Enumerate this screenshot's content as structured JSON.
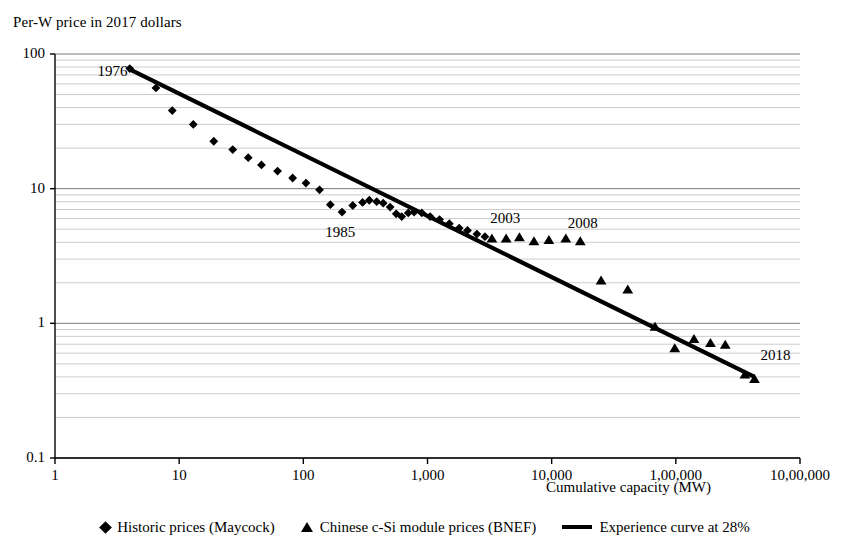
{
  "chart_data": {
    "type": "scatter",
    "title": "",
    "ylabel": "Per-W price in 2017 dollars",
    "xlabel": "Cumulative capacity (MW)",
    "xscale": "log",
    "yscale": "log",
    "xlim": [
      1,
      1000000
    ],
    "ylim": [
      0.1,
      100
    ],
    "grid": true,
    "minor_grid": true,
    "legend_position": "bottom",
    "xticks": [
      1,
      10,
      100,
      1000,
      10000,
      100000,
      1000000
    ],
    "xticklabels": [
      "1",
      "10",
      "100",
      "1,000",
      "10,000",
      "1,00,000",
      "10,00,000"
    ],
    "yticks": [
      0.1,
      1,
      10,
      100
    ],
    "yticklabels": [
      "0.1",
      "1",
      "10",
      "100"
    ],
    "annotations": [
      {
        "text": "1976",
        "x": 2.2,
        "y": 72
      },
      {
        "text": "1985",
        "x": 150,
        "y": 4.6
      },
      {
        "text": "2003",
        "x": 3200,
        "y": 5.9
      },
      {
        "text": "2008",
        "x": 13500,
        "y": 5.4
      },
      {
        "text": "2018",
        "x": 480000,
        "y": 0.56
      }
    ],
    "series": [
      {
        "name": "Historic prices (Maycock)",
        "marker": "diamond",
        "points": [
          [
            4.0,
            78.0
          ],
          [
            6.5,
            56.0
          ],
          [
            8.8,
            38.0
          ],
          [
            13.0,
            30.0
          ],
          [
            19.0,
            22.5
          ],
          [
            27.0,
            19.5
          ],
          [
            36.0,
            17.0
          ],
          [
            46.0,
            15.0
          ],
          [
            62.0,
            13.5
          ],
          [
            82.0,
            12.0
          ],
          [
            105.0,
            11.0
          ],
          [
            135.0,
            9.8
          ],
          [
            165.0,
            7.6
          ],
          [
            205.0,
            6.7
          ],
          [
            250.0,
            7.5
          ],
          [
            300.0,
            7.9
          ],
          [
            340.0,
            8.2
          ],
          [
            390.0,
            8.0
          ],
          [
            440.0,
            7.8
          ],
          [
            500.0,
            7.3
          ],
          [
            560.0,
            6.5
          ],
          [
            620.0,
            6.2
          ],
          [
            700.0,
            6.6
          ],
          [
            780.0,
            6.7
          ],
          [
            900.0,
            6.6
          ],
          [
            1050.0,
            6.2
          ],
          [
            1250.0,
            5.9
          ],
          [
            1500.0,
            5.5
          ],
          [
            1800.0,
            5.1
          ],
          [
            2100.0,
            4.9
          ],
          [
            2500.0,
            4.6
          ],
          [
            2900.0,
            4.4
          ]
        ]
      },
      {
        "name": "Chinese c-Si module prices (BNEF)",
        "marker": "triangle",
        "points": [
          [
            3300,
            4.3
          ],
          [
            4300,
            4.3
          ],
          [
            5500,
            4.4
          ],
          [
            7200,
            4.1
          ],
          [
            9500,
            4.2
          ],
          [
            13000,
            4.3
          ],
          [
            17000,
            4.1
          ],
          [
            25000,
            2.1
          ],
          [
            41000,
            1.8
          ],
          [
            68000,
            0.95
          ],
          [
            98000,
            0.66
          ],
          [
            140000,
            0.77
          ],
          [
            190000,
            0.72
          ],
          [
            250000,
            0.7
          ],
          [
            360000,
            0.42
          ],
          [
            430000,
            0.39
          ]
        ]
      },
      {
        "name": "Experience curve at 28%",
        "marker": "line",
        "learning_rate_percent": 28,
        "line": [
          [
            4.0,
            77.0
          ],
          [
            430000.0,
            0.4
          ]
        ]
      }
    ]
  },
  "legend": {
    "items": [
      {
        "label": "Historic prices (Maycock)",
        "marker": "diamond-marker"
      },
      {
        "label": "Chinese c-Si module prices (BNEF)",
        "marker": "triangle-marker"
      },
      {
        "label": "Experience curve at 28%",
        "marker": "line-marker"
      }
    ]
  },
  "colors": {
    "foreground": "#000000",
    "gridline_major": "#7a7a7a",
    "gridline_minor": "#c0c0c0",
    "background": "#ffffff"
  }
}
